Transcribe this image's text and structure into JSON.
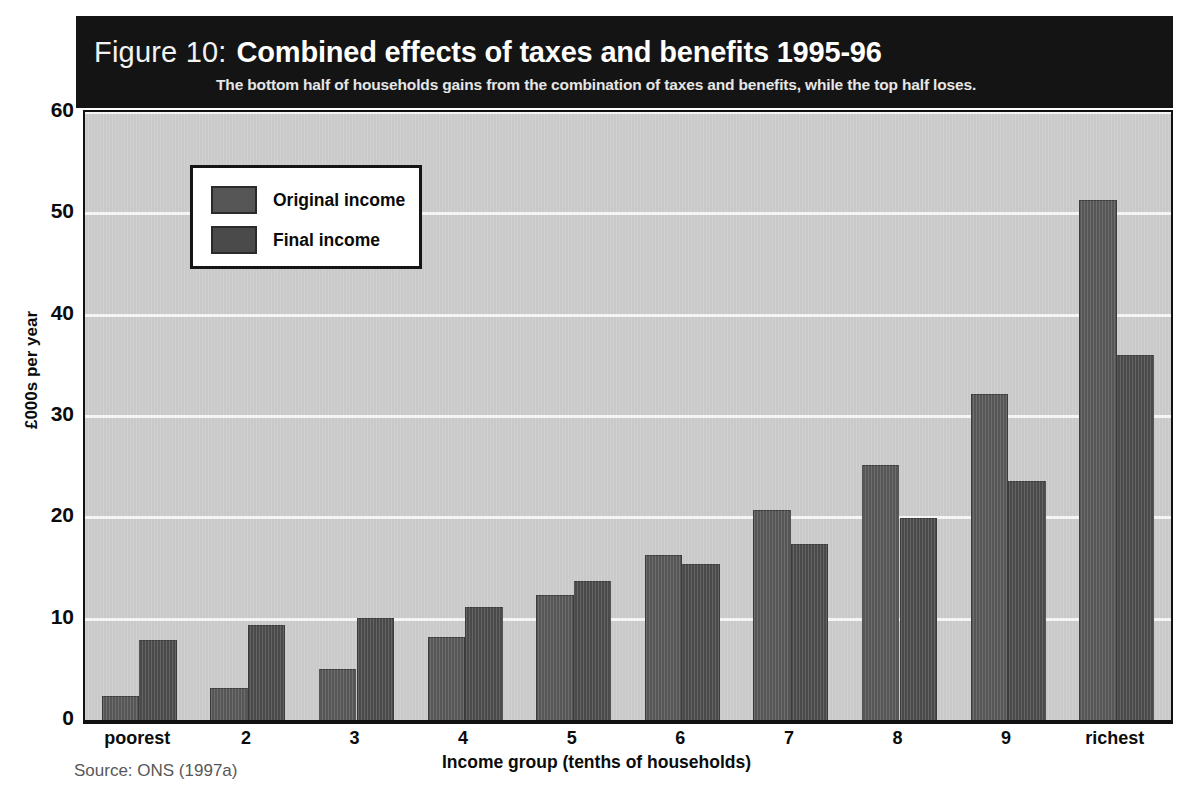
{
  "figure": {
    "label": "Figure 10:",
    "title": "Combined effects of taxes and benefits 1995-96",
    "subtitle": "The bottom half of households gains from the combination of taxes and benefits, while the top half loses.",
    "source": "Source: ONS (1997a)",
    "banner_color": "#141414",
    "plot_background": "#c9c9c9",
    "gridline_color": "#f4f4f4"
  },
  "legend": {
    "position": "inside-top-left",
    "entries": [
      {
        "label": "Original income",
        "color": "#565656"
      },
      {
        "label": "Final income",
        "color": "#4a4a4a"
      }
    ]
  },
  "chart_data": {
    "type": "bar",
    "title": "Combined effects of taxes and benefits 1995-96",
    "subtitle": "The bottom half of households gains from the combination of taxes and benefits, while the top half loses.",
    "xlabel": "Income group (tenths of households)",
    "ylabel": "£000s per year",
    "ylim": [
      0,
      60
    ],
    "yticks": [
      0,
      10,
      20,
      30,
      40,
      50,
      60
    ],
    "ytick_labels": [
      "0",
      "10",
      "20",
      "30",
      "40",
      "50",
      "60"
    ],
    "grid": true,
    "categories": [
      "poorest",
      "2",
      "3",
      "4",
      "5",
      "6",
      "7",
      "8",
      "9",
      "richest"
    ],
    "series": [
      {
        "name": "Original income",
        "color": "#565656",
        "values": [
          2.4,
          3.2,
          5.0,
          8.2,
          12.3,
          16.3,
          20.7,
          25.2,
          32.2,
          51.3
        ]
      },
      {
        "name": "Final income",
        "color": "#4a4a4a",
        "values": [
          7.9,
          9.4,
          10.1,
          11.2,
          13.7,
          15.4,
          17.4,
          19.9,
          23.6,
          36.0
        ]
      }
    ]
  }
}
